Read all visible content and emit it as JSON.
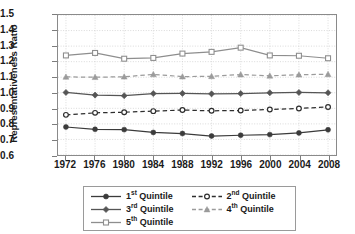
{
  "chart_data": {
    "type": "line",
    "title": "",
    "xlabel": "",
    "ylabel": "Representativeness Ratio",
    "x": [
      1972,
      1976,
      1980,
      1984,
      1988,
      1992,
      1996,
      2000,
      2004,
      2008
    ],
    "xtick_labels": [
      "1972",
      "1976",
      "1980",
      "1984",
      "1988",
      "1992",
      "1996",
      "2000",
      "2004",
      "2008"
    ],
    "ytick_labels": [
      "0.6",
      "0.7",
      "0.8",
      "0.9",
      "1.0",
      "1.1",
      "1.2",
      "1.3",
      "1.4",
      "1.5"
    ],
    "yticks": [
      0.6,
      0.7,
      0.8,
      0.9,
      1.0,
      1.1,
      1.2,
      1.3,
      1.4,
      1.5
    ],
    "ylim": [
      0.6,
      1.5
    ],
    "xlim": [
      1972,
      2008
    ],
    "grid": true,
    "legend_position": "bottom",
    "series": [
      {
        "name": "1st Quintile",
        "label_main": "1",
        "label_sup": "st",
        "label_tail": " Quintile",
        "marker": "filled-circle",
        "linestyle": "solid",
        "color": "#3b3b3b",
        "values": [
          0.78,
          0.765,
          0.763,
          0.745,
          0.738,
          0.722,
          0.727,
          0.731,
          0.742,
          0.762
        ]
      },
      {
        "name": "2nd Quintile",
        "label_main": "2",
        "label_sup": "nd",
        "label_tail": " Quintile",
        "marker": "open-circle",
        "linestyle": "dashed",
        "color": "#2e2e2e",
        "values": [
          0.858,
          0.871,
          0.875,
          0.882,
          0.889,
          0.884,
          0.886,
          0.893,
          0.899,
          0.909
        ]
      },
      {
        "name": "3rd Quintile",
        "label_main": "3",
        "label_sup": "rd",
        "label_tail": " Quintile",
        "marker": "filled-diamond",
        "linestyle": "solid",
        "color": "#555555",
        "values": [
          1.002,
          0.985,
          0.981,
          0.995,
          0.996,
          0.993,
          0.995,
          1.0,
          1.002,
          1.0
        ]
      },
      {
        "name": "4th Quintile",
        "label_main": "4",
        "label_sup": "th",
        "label_tail": " Quintile",
        "marker": "filled-triangle",
        "linestyle": "dashed",
        "color": "#9b9b9b",
        "values": [
          1.102,
          1.1,
          1.103,
          1.118,
          1.104,
          1.106,
          1.117,
          1.109,
          1.116,
          1.119
        ]
      },
      {
        "name": "5th Quintile",
        "label_main": "5",
        "label_sup": "th",
        "label_tail": " Quintile",
        "marker": "open-square",
        "linestyle": "solid",
        "color": "#8e8e8e",
        "values": [
          1.24,
          1.256,
          1.219,
          1.224,
          1.252,
          1.263,
          1.29,
          1.24,
          1.238,
          1.222
        ]
      }
    ]
  }
}
